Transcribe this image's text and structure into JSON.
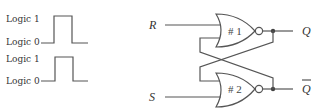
{
  "waveforms": [
    {
      "logic1_label": "Logic 1",
      "logic0_label": "Logic 0"
    },
    {
      "logic1_label": "Logic 1",
      "logic0_label": "Logic 0"
    }
  ],
  "circuit": {
    "input_r": "R",
    "input_s": "S",
    "output_q": "Q",
    "output_qbar": "Q",
    "gate1_label": "# 1",
    "gate2_label": "# 2",
    "gate_type": "NOR"
  },
  "colors": {
    "line": "#555555",
    "text": "#333333"
  }
}
